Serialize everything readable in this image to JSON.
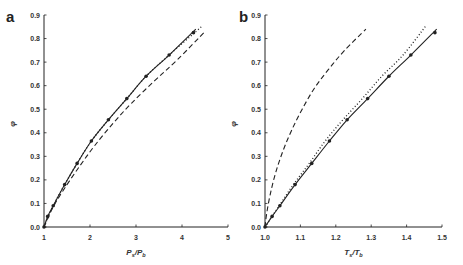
{
  "chart_data": [
    {
      "panel": "a",
      "type": "line",
      "xlabel": "Ps/Pb",
      "xlabel_main": "P",
      "xlabel_sub1": "s",
      "xlabel_sub2": "b",
      "ylabel": "φ",
      "xlim": [
        1,
        5
      ],
      "ylim": [
        0,
        0.9
      ],
      "xticks": [
        "1",
        "2",
        "3",
        "4",
        "5"
      ],
      "yticks": [
        "0.0",
        "0.1",
        "0.2",
        "0.3",
        "0.4",
        "0.5",
        "0.6",
        "0.7",
        "0.8",
        "0.9"
      ],
      "grid": false,
      "series": [
        {
          "name": "markers",
          "style": "points",
          "x": [
            1.0,
            1.08,
            1.2,
            1.45,
            1.72,
            2.03,
            2.4,
            2.8,
            3.22,
            3.72,
            4.25
          ],
          "y": [
            0.0,
            0.045,
            0.09,
            0.18,
            0.27,
            0.365,
            0.455,
            0.545,
            0.64,
            0.73,
            0.825
          ]
        },
        {
          "name": "solid",
          "style": "solid",
          "x": [
            1.0,
            1.08,
            1.2,
            1.45,
            1.72,
            2.03,
            2.4,
            2.8,
            3.22,
            3.72,
            4.3
          ],
          "y": [
            0.0,
            0.045,
            0.09,
            0.18,
            0.27,
            0.365,
            0.455,
            0.545,
            0.64,
            0.73,
            0.84
          ]
        },
        {
          "name": "dotted",
          "style": "dotted",
          "x": [
            1.0,
            1.2,
            1.45,
            1.72,
            2.03,
            2.4,
            2.8,
            3.22,
            3.72,
            4.45
          ],
          "y": [
            0.0,
            0.09,
            0.18,
            0.27,
            0.365,
            0.455,
            0.545,
            0.64,
            0.73,
            0.855
          ]
        },
        {
          "name": "dashed",
          "style": "dashed",
          "x": [
            1.0,
            1.2,
            1.5,
            1.8,
            2.1,
            2.5,
            2.9,
            3.4,
            3.9,
            4.5
          ],
          "y": [
            0.0,
            0.085,
            0.18,
            0.265,
            0.345,
            0.44,
            0.525,
            0.62,
            0.71,
            0.83
          ]
        }
      ]
    },
    {
      "panel": "b",
      "type": "line",
      "xlabel": "Ts/Tb",
      "xlabel_main": "T",
      "xlabel_sub1": "s",
      "xlabel_sub2": "b",
      "ylabel": "φ",
      "xlim": [
        1.0,
        1.5
      ],
      "ylim": [
        0,
        0.9
      ],
      "xticks": [
        "1.0",
        "1.1",
        "1.2",
        "1.3",
        "1.4",
        "1.5"
      ],
      "yticks": [
        "0.0",
        "0.1",
        "0.2",
        "0.3",
        "0.4",
        "0.5",
        "0.6",
        "0.7",
        "0.8",
        "0.9"
      ],
      "grid": false,
      "series": [
        {
          "name": "markers",
          "style": "points",
          "x": [
            1.0,
            1.02,
            1.042,
            1.085,
            1.132,
            1.182,
            1.232,
            1.29,
            1.35,
            1.412,
            1.48
          ],
          "y": [
            0.0,
            0.045,
            0.09,
            0.18,
            0.27,
            0.365,
            0.455,
            0.545,
            0.64,
            0.73,
            0.825
          ]
        },
        {
          "name": "solid",
          "style": "solid",
          "x": [
            1.0,
            1.02,
            1.042,
            1.085,
            1.132,
            1.182,
            1.232,
            1.29,
            1.35,
            1.412,
            1.485
          ],
          "y": [
            0.0,
            0.045,
            0.09,
            0.18,
            0.27,
            0.365,
            0.455,
            0.545,
            0.64,
            0.73,
            0.84
          ]
        },
        {
          "name": "dotted",
          "style": "dotted",
          "x": [
            1.0,
            1.04,
            1.08,
            1.125,
            1.17,
            1.22,
            1.275,
            1.33,
            1.39,
            1.455
          ],
          "y": [
            0.0,
            0.09,
            0.18,
            0.27,
            0.365,
            0.455,
            0.545,
            0.64,
            0.73,
            0.855
          ]
        },
        {
          "name": "dashed",
          "style": "dashed",
          "x": [
            1.0,
            1.005,
            1.015,
            1.03,
            1.05,
            1.075,
            1.105,
            1.14,
            1.18,
            1.225,
            1.285
          ],
          "y": [
            0.0,
            0.06,
            0.14,
            0.23,
            0.32,
            0.41,
            0.5,
            0.59,
            0.67,
            0.75,
            0.84
          ]
        }
      ]
    }
  ],
  "labels": {
    "panel_a": "a",
    "panel_b": "b",
    "ylabel": "φ"
  }
}
